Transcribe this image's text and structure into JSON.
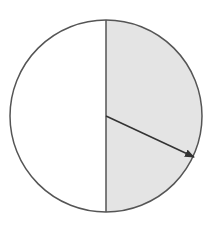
{
  "diagram": {
    "type": "circle-half-shaded-with-radius-arrow",
    "colors": {
      "stroke": "#555555",
      "shaded_fill": "#e4e4e4",
      "unshaded_fill": "#ffffff",
      "arrow": "#333333"
    },
    "circle": {
      "cx": 106,
      "cy": 116,
      "r": 96
    },
    "shaded_half": "right",
    "arrow": {
      "x1": 106,
      "y1": 116,
      "x2": 194,
      "y2": 157
    }
  }
}
